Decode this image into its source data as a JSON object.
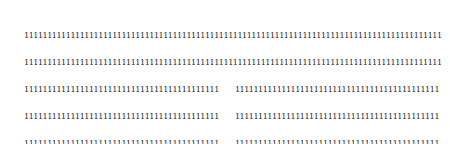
{
  "pattern": {
    "glyph": "1",
    "rows_total": 13,
    "chars_per_row": 90,
    "gap_rows": [
      3,
      4,
      5,
      6,
      7,
      8,
      9,
      10,
      11
    ],
    "rows": [
      {
        "full": "111111111111111111111111111111111111111111111111111111111111111111111111111111111111111111"
      },
      {
        "full": "111111111111111111111111111111111111111111111111111111111111111111111111111111111111111111"
      },
      {
        "left": "111111111111111111111111111111111111111111",
        "right": "11111111111111111111111111111111111111111111"
      },
      {
        "left": "111111111111111111111111111111111111111111",
        "right": "11111111111111111111111111111111111111111111"
      },
      {
        "left": "111111111111111111111111111111111111111111",
        "right": "11111111111111111111111111111111111111111111"
      },
      {
        "left": "111111111111111111111111111111111111111111",
        "right": "11111111111111111111111111111111111111111111"
      },
      {
        "left": "111111111111111111111111111111111111111111",
        "right": "11111111111111111111111111111111111111111111"
      },
      {
        "left": "111111111111111111111111111111111111111111",
        "right": "11111111111111111111111111111111111111111111"
      },
      {
        "left": "111111111111111111111111111111111111111111",
        "right": "11111111111111111111111111111111111111111111"
      },
      {
        "left": "111111111111111111111111111111111111111111",
        "right": "11111111111111111111111111111111111111111111"
      },
      {
        "left": "111111111111111111111111111111111111111111",
        "right": "11111111111111111111111111111111111111111111"
      },
      {
        "full": "111111111111111111111111111111111111111111111111111111111111111111111111111111111111111111"
      },
      {
        "full": "111111111111111111111111111111111111111111111111111111111111111111111111111111111111111111"
      }
    ]
  },
  "colors": {
    "background": "#ffffff",
    "text": "#2a2a2a"
  }
}
